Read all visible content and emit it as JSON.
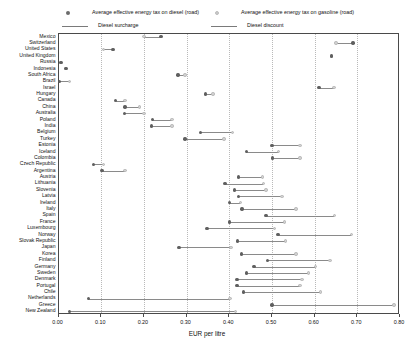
{
  "legend": {
    "items": [
      {
        "marker": "diesel-dot-icon",
        "label": "Average effective energy tax on diesel (road)"
      },
      {
        "marker": "gasoline-dot-icon",
        "label": "Average effective energy tax on gasoline (road)"
      },
      {
        "marker": "surcharge-line-icon",
        "label": "Diesel surcharge"
      },
      {
        "marker": "discount-line-icon",
        "label": "Diesel discount"
      }
    ]
  },
  "colors": {
    "diesel": "#5f5f5f",
    "gasoline": "#d2d2d2",
    "connector": "#8a8a8a",
    "frame": "#4a4a4a",
    "grid": "#b9b9b9"
  },
  "chart_data": {
    "type": "scatter",
    "title": "",
    "xlabel": "EUR per litre",
    "ylabel": "",
    "xlim": [
      0.0,
      0.8
    ],
    "xticks": [
      "0.00",
      "0.10",
      "0.20",
      "0.30",
      "0.40",
      "0.50",
      "0.60",
      "0.70",
      "0.80"
    ],
    "xtick_values": [
      0.0,
      0.1,
      0.2,
      0.3,
      0.4,
      0.5,
      0.6,
      0.7,
      0.8
    ],
    "grid": true,
    "legend_position": "top",
    "series": [
      {
        "name": "Average effective energy tax on diesel (road)",
        "key": "diesel"
      },
      {
        "name": "Average effective energy tax on gasoline (road)",
        "key": "gasoline"
      }
    ],
    "categories": [
      "Mexico",
      "Switzerland",
      "United States",
      "United Kingdom",
      "Russia",
      "Indonesia",
      "South Africa",
      "Brazil",
      "Israel",
      "Hungary",
      "Canada",
      "China",
      "Australia",
      "Poland",
      "India",
      "Belgium",
      "Turkey",
      "Estonia",
      "Iceland",
      "Colombia",
      "Czech Republic",
      "Argentina",
      "Austria",
      "Lithuania",
      "Slovenia",
      "Latvia",
      "Ireland",
      "Italy",
      "Spain",
      "France",
      "Luxembourg",
      "Norway",
      "Slovak Republic",
      "Japan",
      "Korea",
      "Finland",
      "Germany",
      "Sweden",
      "Denmark",
      "Portugal",
      "Chile",
      "Netherlands",
      "Greece",
      "New Zealand"
    ],
    "rows": [
      {
        "country": "Mexico",
        "diesel": 0.24,
        "gasoline": 0.2
      },
      {
        "country": "Switzerland",
        "diesel": 0.69,
        "gasoline": 0.65
      },
      {
        "country": "United States",
        "diesel": 0.128,
        "gasoline": 0.105
      },
      {
        "country": "United Kingdom",
        "diesel": 0.64,
        "gasoline": 0.64
      },
      {
        "country": "Russia",
        "diesel": 0.006,
        "gasoline": 0.004
      },
      {
        "country": "Indonesia",
        "diesel": 0.018,
        "gasoline": 0.016
      },
      {
        "country": "South Africa",
        "diesel": 0.28,
        "gasoline": 0.296
      },
      {
        "country": "Brazil",
        "diesel": 0.002,
        "gasoline": 0.026
      },
      {
        "country": "Israel",
        "diesel": 0.61,
        "gasoline": 0.645
      },
      {
        "country": "Hungary",
        "diesel": 0.345,
        "gasoline": 0.362
      },
      {
        "country": "Canada",
        "diesel": 0.134,
        "gasoline": 0.156
      },
      {
        "country": "China",
        "diesel": 0.156,
        "gasoline": 0.19
      },
      {
        "country": "Australia",
        "diesel": 0.155,
        "gasoline": 0.2
      },
      {
        "country": "Poland",
        "diesel": 0.22,
        "gasoline": 0.266
      },
      {
        "country": "India",
        "diesel": 0.218,
        "gasoline": 0.266
      },
      {
        "country": "Belgium",
        "diesel": 0.332,
        "gasoline": 0.408
      },
      {
        "country": "Turkey",
        "diesel": 0.296,
        "gasoline": 0.388
      },
      {
        "country": "Estonia",
        "diesel": 0.5,
        "gasoline": 0.566
      },
      {
        "country": "Iceland",
        "diesel": 0.44,
        "gasoline": 0.516
      },
      {
        "country": "Colombia",
        "diesel": 0.502,
        "gasoline": 0.566
      },
      {
        "country": "Czech Republic",
        "diesel": 0.082,
        "gasoline": 0.106
      },
      {
        "country": "Argentina",
        "diesel": 0.102,
        "gasoline": 0.156
      },
      {
        "country": "Austria",
        "diesel": 0.422,
        "gasoline": 0.478
      },
      {
        "country": "Lithuania",
        "diesel": 0.39,
        "gasoline": 0.48
      },
      {
        "country": "Slovenia",
        "diesel": 0.412,
        "gasoline": 0.486
      },
      {
        "country": "Latvia",
        "diesel": 0.422,
        "gasoline": 0.524
      },
      {
        "country": "Ireland",
        "diesel": 0.4,
        "gasoline": 0.426
      },
      {
        "country": "Italy",
        "diesel": 0.43,
        "gasoline": 0.556
      },
      {
        "country": "Spain",
        "diesel": 0.486,
        "gasoline": 0.646
      },
      {
        "country": "France",
        "diesel": 0.4,
        "gasoline": 0.53
      },
      {
        "country": "Luxembourg",
        "diesel": 0.348,
        "gasoline": 0.506
      },
      {
        "country": "Norway",
        "diesel": 0.514,
        "gasoline": 0.686
      },
      {
        "country": "Slovak Republic",
        "diesel": 0.42,
        "gasoline": 0.532
      },
      {
        "country": "Japan",
        "diesel": 0.282,
        "gasoline": 0.404
      },
      {
        "country": "Korea",
        "diesel": 0.428,
        "gasoline": 0.556
      },
      {
        "country": "Finland",
        "diesel": 0.49,
        "gasoline": 0.636
      },
      {
        "country": "Germany",
        "diesel": 0.458,
        "gasoline": 0.602
      },
      {
        "country": "Sweden",
        "diesel": 0.44,
        "gasoline": 0.586
      },
      {
        "country": "Denmark",
        "diesel": 0.418,
        "gasoline": 0.57
      },
      {
        "country": "Portugal",
        "diesel": 0.418,
        "gasoline": 0.566
      },
      {
        "country": "Chile",
        "diesel": 0.434,
        "gasoline": 0.614
      },
      {
        "country": "Netherlands",
        "diesel": 0.07,
        "gasoline": 0.402
      },
      {
        "country": "Greece",
        "diesel": 0.5,
        "gasoline": 0.786
      },
      {
        "country": "New Zealand",
        "diesel": 0.026,
        "gasoline": 0.414
      }
    ]
  }
}
